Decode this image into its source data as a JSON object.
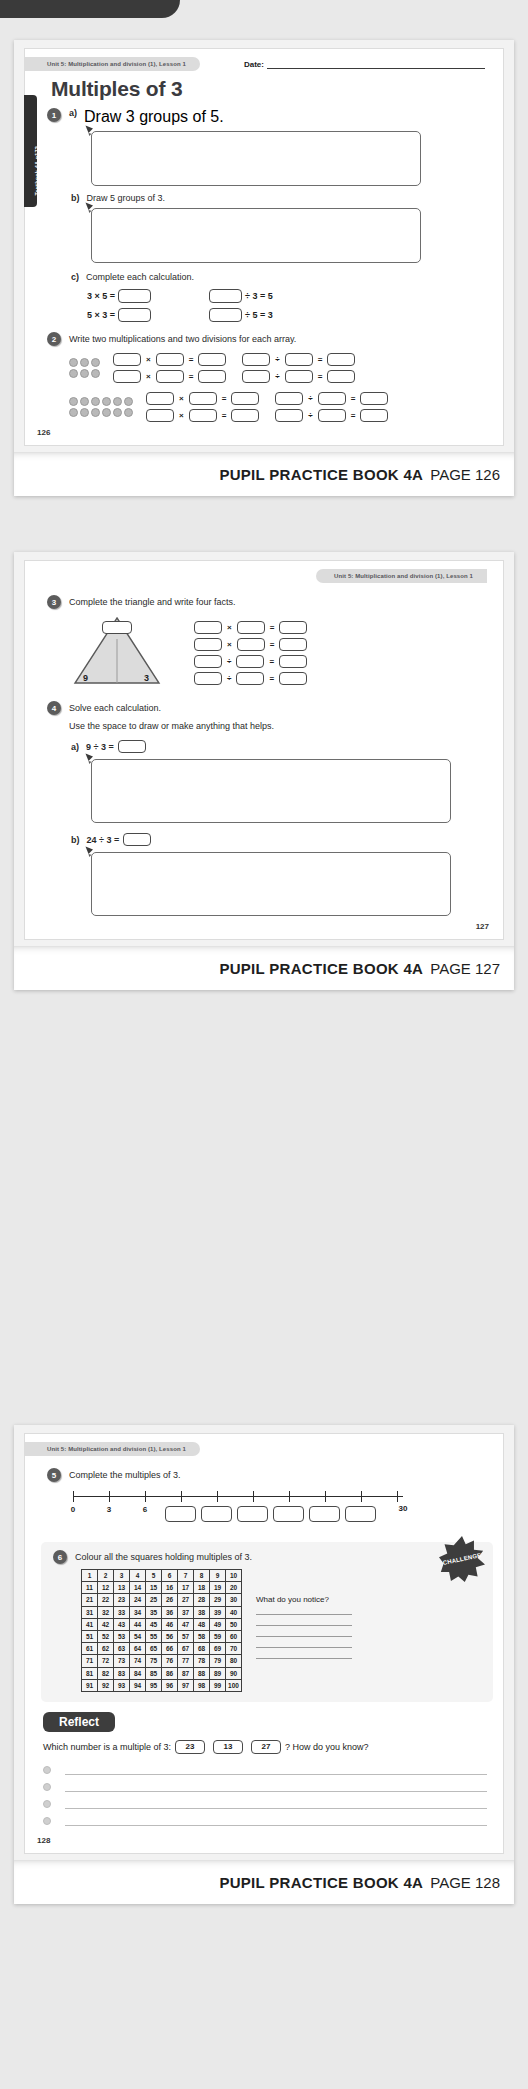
{
  "banner": {
    "strong": "PUPIL PRACTICE BOOK 4A",
    "page126": "PAGE 126",
    "page127": "PAGE 127",
    "page128": "PAGE 128"
  },
  "page126": {
    "unit_tag": "Unit 5: Multiplication and division (1), Lesson 1",
    "date_label": "Date:",
    "side_tab": "→ Textbook 4A p172",
    "title": "Multiples of 3",
    "q1": {
      "number": "1",
      "a_label": "a)",
      "a_text": "Draw 3 groups of 5.",
      "b_label": "b)",
      "b_text": "Draw 5 groups of 3.",
      "c_label": "c)",
      "c_text": "Complete each calculation.",
      "calcs": [
        {
          "left": "3 × 5 =",
          "right_pre": "",
          "right_post": "÷ 3 = 5"
        },
        {
          "left": "5 × 3 =",
          "right_pre": "",
          "right_post": "÷ 5 = 3"
        }
      ]
    },
    "q2": {
      "number": "2",
      "text": "Write two multiplications and two divisions for each array.",
      "arrays": [
        {
          "rows": 2,
          "cols": 3
        },
        {
          "rows": 2,
          "cols": 6
        }
      ],
      "mult_op": "×",
      "div_op": "÷",
      "equals": "="
    },
    "page_number": "126"
  },
  "page127": {
    "unit_tag": "Unit 5: Multiplication and division (1), Lesson 1",
    "q3": {
      "number": "3",
      "text": "Complete the triangle and write four facts.",
      "tri_left": "9",
      "tri_right": "3",
      "fact_ops": [
        "×",
        "×",
        "÷",
        "÷"
      ],
      "equals": "="
    },
    "q4": {
      "number": "4",
      "text": "Solve each calculation.",
      "text2": "Use the space to draw or make anything that helps.",
      "a_label": "a)",
      "a_calc": "9 ÷ 3 =",
      "b_label": "b)",
      "b_calc": "24 ÷ 3 ="
    },
    "page_number": "127"
  },
  "page128": {
    "unit_tag": "Unit 5: Multiplication and division (1), Lesson 1",
    "q5": {
      "number": "5",
      "text": "Complete the multiples of 3.",
      "labels": [
        "0",
        "3",
        "6"
      ],
      "end_label": "30",
      "blank_boxes": 7
    },
    "q6": {
      "number": "6",
      "text": "Colour all the squares holding multiples of 3.",
      "challenge_label": "CHALLENGE",
      "notice_question": "What do you notice?",
      "notice_lines": 5,
      "grid_rows": [
        [
          "1",
          "2",
          "3",
          "4",
          "5",
          "6",
          "7",
          "8",
          "9",
          "10"
        ],
        [
          "11",
          "12",
          "13",
          "14",
          "15",
          "16",
          "17",
          "18",
          "19",
          "20"
        ],
        [
          "21",
          "22",
          "23",
          "24",
          "25",
          "26",
          "27",
          "28",
          "29",
          "30"
        ],
        [
          "31",
          "32",
          "33",
          "34",
          "35",
          "36",
          "37",
          "38",
          "39",
          "40"
        ],
        [
          "41",
          "42",
          "43",
          "44",
          "45",
          "46",
          "47",
          "48",
          "49",
          "50"
        ],
        [
          "51",
          "52",
          "53",
          "54",
          "55",
          "56",
          "57",
          "58",
          "59",
          "60"
        ],
        [
          "61",
          "62",
          "63",
          "64",
          "65",
          "66",
          "67",
          "68",
          "69",
          "70"
        ],
        [
          "71",
          "72",
          "73",
          "74",
          "75",
          "76",
          "77",
          "78",
          "79",
          "80"
        ],
        [
          "81",
          "82",
          "83",
          "84",
          "85",
          "86",
          "87",
          "88",
          "89",
          "90"
        ],
        [
          "91",
          "92",
          "93",
          "94",
          "95",
          "96",
          "97",
          "98",
          "99",
          "100"
        ]
      ]
    },
    "reflect": {
      "title": "Reflect",
      "question_pre": "Which number is a multiple of 3:",
      "options": [
        "23",
        "13",
        "27"
      ],
      "question_post": "? How do you know?",
      "answer_lines": 4
    },
    "page_number": "128"
  },
  "colors": {
    "dark": "#3a3a3a",
    "tag_bg": "#dcdcdc",
    "dot": "#b9b9b9",
    "challenge": "#3d3d3d"
  }
}
